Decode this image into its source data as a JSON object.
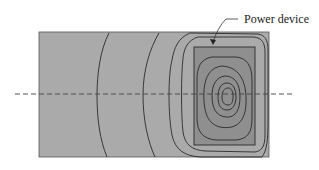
{
  "diagram": {
    "type": "thermal-contour-map",
    "label": "Power device",
    "colors": {
      "substrate": "#aaaaaa",
      "device": "#8f8f8f",
      "contour": "#2a2a2a",
      "dashed_line": "#444444",
      "background": "#ffffff"
    },
    "elements": {
      "substrate": "substrate-rectangle",
      "device": "power-device-rectangle",
      "section_line": "dashed-cross-section-line",
      "leader": "label-leader-arrow"
    }
  }
}
